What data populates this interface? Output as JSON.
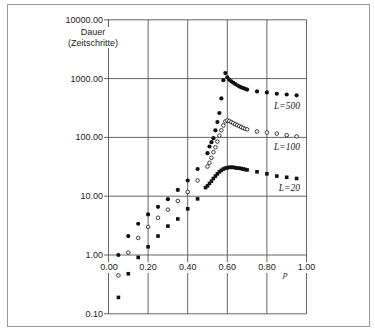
{
  "chart_data": {
    "type": "scatter",
    "title": "",
    "xlabel": "p",
    "ylabel": "Dauer (Zeitschritte)",
    "ylabel_lines": [
      "Dauer",
      "(Zeitschritte)"
    ],
    "xscale": "linear",
    "yscale": "log",
    "xlim": [
      0.0,
      1.0
    ],
    "ylim": [
      0.1,
      10000
    ],
    "x_ticks": [
      0.0,
      0.2,
      0.4,
      0.6,
      0.8,
      1.0
    ],
    "x_tick_labels": [
      "0.00",
      "0.20",
      "0.40",
      "0.60",
      "0.80",
      "1.00"
    ],
    "y_ticks": [
      10000,
      1000,
      100,
      10,
      1,
      0.1
    ],
    "y_tick_labels": [
      "10000.00",
      "1000.00",
      "100.00",
      "10.00",
      "1.00",
      "0.10"
    ],
    "grid": true,
    "legend_position": "inline labels at right end of each series",
    "colors": {
      "marker": "#111111",
      "grid": "#555555",
      "frame": "#9a9a9a"
    },
    "series": [
      {
        "name": "L=500",
        "marker": "filled-circle",
        "x": [
          0.05,
          0.1,
          0.15,
          0.2,
          0.25,
          0.3,
          0.35,
          0.4,
          0.45,
          0.5,
          0.51,
          0.52,
          0.53,
          0.54,
          0.55,
          0.56,
          0.57,
          0.58,
          0.59,
          0.6,
          0.61,
          0.62,
          0.63,
          0.64,
          0.65,
          0.66,
          0.67,
          0.68,
          0.69,
          0.7,
          0.75,
          0.8,
          0.85,
          0.9,
          0.95
        ],
        "values": [
          1.0,
          2.1,
          3.4,
          4.9,
          6.6,
          8.9,
          12.8,
          18.5,
          29,
          54,
          70,
          83,
          97,
          132,
          182,
          260,
          460,
          940,
          1240,
          1050,
          960,
          900,
          850,
          810,
          770,
          740,
          710,
          690,
          670,
          650,
          605,
          582,
          553,
          537,
          520
        ]
      },
      {
        "name": "L=100",
        "marker": "open-circle",
        "x": [
          0.05,
          0.1,
          0.15,
          0.2,
          0.25,
          0.3,
          0.35,
          0.4,
          0.45,
          0.5,
          0.51,
          0.52,
          0.53,
          0.54,
          0.55,
          0.56,
          0.57,
          0.58,
          0.59,
          0.6,
          0.61,
          0.62,
          0.63,
          0.64,
          0.65,
          0.66,
          0.67,
          0.68,
          0.69,
          0.7,
          0.75,
          0.8,
          0.85,
          0.9,
          0.95
        ],
        "values": [
          0.45,
          1.1,
          1.95,
          3.0,
          4.3,
          5.9,
          8.3,
          11.8,
          18.5,
          32,
          37,
          45,
          56,
          68,
          85,
          107,
          132,
          160,
          187,
          195,
          190,
          182,
          175,
          168,
          162,
          156,
          150,
          145,
          140,
          137,
          126,
          121,
          116,
          109,
          104
        ]
      },
      {
        "name": "L=20",
        "marker": "filled-square",
        "x": [
          0.05,
          0.1,
          0.15,
          0.2,
          0.25,
          0.3,
          0.35,
          0.4,
          0.45,
          0.49,
          0.5,
          0.51,
          0.52,
          0.53,
          0.54,
          0.55,
          0.56,
          0.57,
          0.58,
          0.59,
          0.6,
          0.61,
          0.62,
          0.63,
          0.64,
          0.65,
          0.66,
          0.67,
          0.68,
          0.69,
          0.7,
          0.75,
          0.8,
          0.85,
          0.9,
          0.95
        ],
        "values": [
          0.19,
          0.48,
          0.91,
          1.38,
          2.1,
          3.1,
          4.1,
          6.1,
          9,
          14,
          15,
          16.5,
          18,
          20,
          22,
          24,
          26,
          27.5,
          29,
          30,
          30.5,
          31,
          31,
          31,
          30.5,
          30,
          30,
          29.5,
          29,
          28.5,
          28,
          26,
          24,
          22,
          21,
          20
        ]
      }
    ]
  }
}
